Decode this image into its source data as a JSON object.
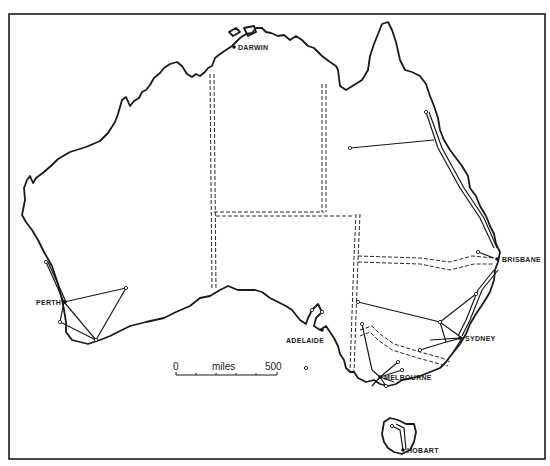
{
  "map": {
    "title": "Australia — state capitals and connecting routes",
    "frame_color": "#1a1a1a",
    "background": "#ffffff",
    "cities": [
      {
        "name": "DARWIN",
        "x": 236,
        "y": 47
      },
      {
        "name": "BRISBANE",
        "x": 500,
        "y": 259
      },
      {
        "name": "SYDNEY",
        "x": 462,
        "y": 338
      },
      {
        "name": "MELBOURNE",
        "x": 380,
        "y": 377
      },
      {
        "name": "ADELAIDE",
        "x": 322,
        "y": 329
      },
      {
        "name": "PERTH",
        "x": 65,
        "y": 302
      },
      {
        "name": "HOBART",
        "x": 403,
        "y": 450
      }
    ],
    "scale_bar": {
      "start_label": "0",
      "unit_label": "miles",
      "end_label": "500"
    }
  }
}
